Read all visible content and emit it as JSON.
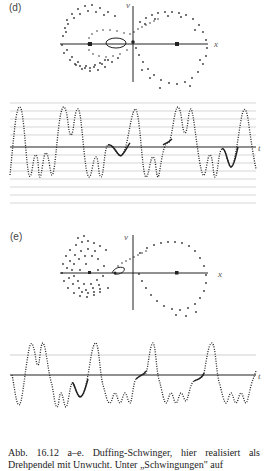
{
  "figure": {
    "panels": [
      {
        "id": "d",
        "label": "(d)",
        "phase_portrait": {
          "x_axis_label": "x",
          "y_axis_label": "v"
        },
        "time_series": {
          "axis_label": "t"
        }
      },
      {
        "id": "e",
        "label": "(e)",
        "phase_portrait": {
          "x_axis_label": "x",
          "y_axis_label": "v"
        },
        "time_series": {
          "axis_label": "t"
        }
      }
    ],
    "caption": {
      "line1": "Abb. 16.12 a–e. Duffing-Schwinger, hier realisiert als",
      "line2": "Drehpendel mit Unwucht. Unter „Schwingungen\" auf"
    }
  },
  "colors": {
    "axis": "#222222",
    "dots": "#333333",
    "grid": "#bbbbbb"
  }
}
